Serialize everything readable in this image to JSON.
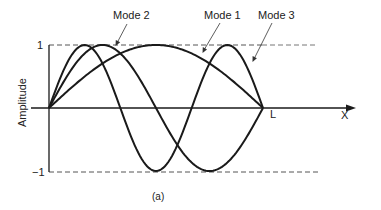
{
  "figure": {
    "caption": "(a)",
    "y_axis_label": "Amplitude",
    "x_axis_label": "X",
    "y_tick_top": "1",
    "y_tick_bottom": "−1",
    "x_end_label": "L",
    "mode_labels": [
      "Mode 2",
      "Mode 1",
      "Mode 3"
    ],
    "colors": {
      "curve": "#1a1a1a",
      "axis": "#1a1a1a",
      "dashed": "#555555"
    }
  },
  "geometry": {
    "origin_x": 49,
    "axis_y": 108,
    "length_L_x": 263,
    "amp_px": 63,
    "x_arrow_end": 355
  },
  "chart_data": {
    "type": "line",
    "title": "",
    "xlabel": "X",
    "ylabel": "Amplitude",
    "xlim": [
      0,
      1
    ],
    "ylim": [
      -1,
      1
    ],
    "x_ticks": [
      "L"
    ],
    "y_ticks": [
      "1",
      "-1"
    ],
    "annotation_caption": "(a)",
    "series": [
      {
        "name": "Mode 1",
        "function": "sin(pi*x/L)",
        "peaks": [
          {
            "x": 0.5,
            "y": 1
          }
        ]
      },
      {
        "name": "Mode 2",
        "function": "sin(2*pi*x/L)",
        "peaks": [
          {
            "x": 0.25,
            "y": 1
          },
          {
            "x": 0.75,
            "y": -1
          }
        ]
      },
      {
        "name": "Mode 3",
        "function": "sin(3*pi*x/L)",
        "peaks": [
          {
            "x": 0.1667,
            "y": 1
          },
          {
            "x": 0.5,
            "y": -1
          },
          {
            "x": 0.8333,
            "y": 1
          }
        ]
      }
    ],
    "reference_lines": [
      {
        "y": 1,
        "style": "dashed"
      },
      {
        "y": -1,
        "style": "dashed"
      }
    ]
  }
}
